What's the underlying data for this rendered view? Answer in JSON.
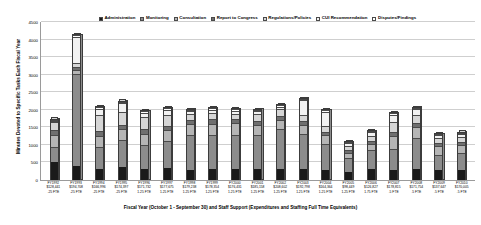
{
  "chart_data": {
    "type": "bar",
    "subtype": "stacked-3d-column",
    "title": "",
    "xlabel": "Fiscal Year (October 1 - September 30) and Staff Support (Expenditures and Staffing Full Time Equivalents)",
    "ylabel": "Minutes Devoted to Specific Tasks Each Fiscal Year",
    "ylim": [
      0,
      4500
    ],
    "yticks": [
      0,
      500,
      1000,
      1500,
      2000,
      2500,
      3000,
      3500,
      4000,
      4500
    ],
    "ytick_labels": [
      "0",
      "500",
      "1000",
      "1500",
      "2000",
      "2500",
      "3000",
      "3500",
      "4000",
      "4500"
    ],
    "grid": true,
    "legend_position": "top-center",
    "categories": [
      "FY1992",
      "FY1993",
      "FY1994",
      "FY1995",
      "FY1996",
      "FY1997",
      "FY1998",
      "FY1999",
      "FY2000",
      "FY2001",
      "FY2002",
      "FY2003",
      "FY2004",
      "FY2005",
      "FY2006",
      "FY2007",
      "FY2008",
      "FY2009",
      "FY2010"
    ],
    "category_sublabels": [
      [
        "$128,441",
        ".25 FTE"
      ],
      [
        "$194,708",
        ".25 FTE"
      ],
      [
        "$166,996",
        ".25 FTE"
      ],
      [
        "$174,397",
        ".25 FTE"
      ],
      [
        "$171,732",
        "1.25 FTE"
      ],
      [
        "$177,675",
        "1.25 FTE"
      ],
      [
        "$179,238",
        "1.25 FTE"
      ],
      [
        "$178,354",
        "1.25 FTE"
      ],
      [
        "$176,431",
        "1.25 FTE"
      ],
      [
        "$185,158",
        "1.25 FTE"
      ],
      [
        "$208,602",
        "1.25 FTE"
      ],
      [
        "$192,798",
        "1.25 FTE"
      ],
      [
        "$164,364",
        "1.25 FTE"
      ],
      [
        "$98,449",
        "1.25 FTE"
      ],
      [
        "$126,827",
        "1.75 FTE"
      ],
      [
        "$178,815",
        ".5 FTE"
      ],
      [
        "$171,754",
        ".5 FTE"
      ],
      [
        "$137,647",
        ".5 FTE"
      ],
      [
        "$170,005",
        ".5 FTE"
      ]
    ],
    "series": [
      {
        "name": "Administration",
        "color": "#1a1a1a",
        "values": [
          520,
          400,
          330,
          380,
          330,
          360,
          300,
          330,
          330,
          320,
          330,
          320,
          300,
          230,
          330,
          300,
          330,
          300,
          300
        ]
      },
      {
        "name": "Monitoring",
        "color": "#8c8c8c",
        "values": [
          430,
          2650,
          620,
          780,
          680,
          760,
          1000,
          970,
          980,
          980,
          1150,
          1000,
          750,
          400,
          540,
          590,
          880,
          430,
          480
        ]
      },
      {
        "name": "Consultation",
        "color": "#b5b5b5",
        "values": [
          360,
          120,
          330,
          310,
          330,
          330,
          320,
          330,
          330,
          300,
          260,
          260,
          240,
          170,
          180,
          380,
          320,
          250,
          230
        ]
      },
      {
        "name": "Report to Congress",
        "color": "#6f6f6f",
        "values": [
          150,
          80,
          130,
          130,
          130,
          120,
          110,
          120,
          110,
          110,
          110,
          110,
          100,
          70,
          90,
          120,
          110,
          90,
          90
        ]
      },
      {
        "name": "Regulations/Policies",
        "color": "#d6d6d6",
        "values": [
          220,
          110,
          480,
          360,
          340,
          300,
          180,
          200,
          170,
          200,
          190,
          180,
          160,
          120,
          150,
          300,
          250,
          150,
          160
        ]
      },
      {
        "name": "CUI Recommendation",
        "color": "#f2f2f2",
        "values": [
          40,
          730,
          170,
          260,
          140,
          160,
          80,
          80,
          80,
          80,
          80,
          430,
          430,
          90,
          100,
          200,
          150,
          80,
          90
        ]
      },
      {
        "name": "Disputes/Findings",
        "color": "#ffffff",
        "values": [
          30,
          60,
          40,
          40,
          40,
          40,
          30,
          40,
          40,
          40,
          40,
          40,
          30,
          20,
          30,
          40,
          40,
          30,
          30
        ]
      }
    ]
  }
}
